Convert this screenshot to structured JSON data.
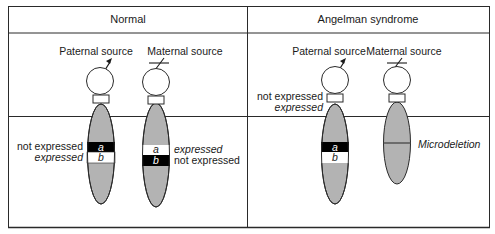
{
  "panels": [
    {
      "title": "Normal",
      "chromosomes": [
        {
          "source_label": "Paternal source",
          "source_symbol": "male-arrow",
          "bands": [
            {
              "gene": "a",
              "fill": "#000000",
              "text_color": "#ffffff",
              "status": "not expressed"
            },
            {
              "gene": "b",
              "fill": "#ffffff",
              "text_color": "#000000",
              "status": "expressed"
            }
          ]
        },
        {
          "source_label": "Maternal source",
          "source_symbol": "slash",
          "bands": [
            {
              "gene": "a",
              "fill": "#ffffff",
              "text_color": "#000000",
              "status": "expressed"
            },
            {
              "gene": "b",
              "fill": "#000000",
              "text_color": "#ffffff",
              "status": "not expressed"
            }
          ]
        }
      ]
    },
    {
      "title": "Angelman syndrome",
      "chromosomes": [
        {
          "source_label": "Paternal source",
          "source_symbol": "male-arrow",
          "status_labels": [
            "not expressed",
            "expressed"
          ],
          "bands": [
            {
              "gene": "a",
              "fill": "#000000",
              "text_color": "#ffffff"
            },
            {
              "gene": "b",
              "fill": "#ffffff",
              "text_color": "#000000"
            }
          ]
        },
        {
          "source_label": "Maternal source",
          "source_symbol": "slash",
          "annotation": "Microdeletion"
        }
      ]
    }
  ],
  "colors": {
    "chromosome_fill": "#b3b3b3",
    "outline": "#2a2a2a",
    "background": "#ffffff"
  }
}
